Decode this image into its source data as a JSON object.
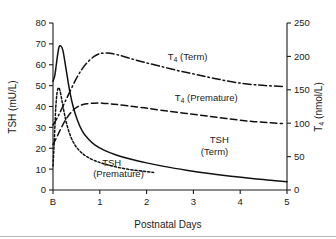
{
  "chart_data": {
    "type": "line",
    "title": "",
    "xlabel": "Postnatal Days",
    "ylabel": "TSH (mU/L)",
    "y2label": "T4 (nmol/L)",
    "xtick_labels": [
      "B",
      "1",
      "2",
      "3",
      "4",
      "5"
    ],
    "xtick_values": [
      0,
      1,
      2,
      3,
      4,
      5
    ],
    "xlim": [
      0,
      5
    ],
    "ytick_labels": [
      "0",
      "10",
      "20",
      "30",
      "40",
      "50",
      "60",
      "70",
      "80"
    ],
    "ytick_values": [
      0,
      10,
      20,
      30,
      40,
      50,
      60,
      70,
      80
    ],
    "ylim": [
      0,
      80
    ],
    "y2tick_labels": [
      "0",
      "50",
      "100",
      "150",
      "200",
      "250"
    ],
    "y2tick_values": [
      0,
      50,
      100,
      150,
      200,
      250
    ],
    "y2lim": [
      0,
      250
    ],
    "grid": false,
    "legend_position": "inline-annotations",
    "series": [
      {
        "name": "TSH (Term)",
        "axis": "left",
        "style": "solid",
        "label_lines": [
          "TSH",
          "(Term)"
        ],
        "label_x": 3.35,
        "label_y_line1": 22.5,
        "label_y_line2": 17.0,
        "points": [
          [
            0.0,
            52.0
          ],
          [
            0.04,
            55.0
          ],
          [
            0.07,
            60.0
          ],
          [
            0.1,
            65.0
          ],
          [
            0.13,
            68.5
          ],
          [
            0.17,
            69.0
          ],
          [
            0.21,
            67.0
          ],
          [
            0.25,
            62.0
          ],
          [
            0.3,
            55.0
          ],
          [
            0.36,
            47.0
          ],
          [
            0.43,
            40.0
          ],
          [
            0.52,
            33.5
          ],
          [
            0.62,
            28.5
          ],
          [
            0.75,
            24.5
          ],
          [
            0.9,
            21.5
          ],
          [
            1.1,
            19.0
          ],
          [
            1.35,
            16.8
          ],
          [
            1.65,
            14.8
          ],
          [
            2.0,
            13.0
          ],
          [
            2.4,
            11.2
          ],
          [
            2.85,
            9.5
          ],
          [
            3.3,
            8.0
          ],
          [
            3.8,
            6.6
          ],
          [
            4.3,
            5.4
          ],
          [
            4.7,
            4.6
          ],
          [
            5.0,
            4.0
          ]
        ]
      },
      {
        "name": "TSH (Premature)",
        "axis": "left",
        "style": "dotted",
        "label_lines": [
          "TSH",
          "(Premature)"
        ],
        "label_x": 1.05,
        "label_y_line1": 11.5,
        "label_y_line2": 6.0,
        "points": [
          [
            0.0,
            11.5
          ],
          [
            0.02,
            20.0
          ],
          [
            0.04,
            30.0
          ],
          [
            0.06,
            40.0
          ],
          [
            0.09,
            47.0
          ],
          [
            0.12,
            49.0
          ],
          [
            0.15,
            47.5
          ],
          [
            0.19,
            43.0
          ],
          [
            0.24,
            37.0
          ],
          [
            0.3,
            31.0
          ],
          [
            0.38,
            25.5
          ],
          [
            0.47,
            21.5
          ],
          [
            0.58,
            18.5
          ],
          [
            0.72,
            16.0
          ],
          [
            0.9,
            14.0
          ],
          [
            1.12,
            12.3
          ],
          [
            1.4,
            10.8
          ],
          [
            1.7,
            9.6
          ],
          [
            2.0,
            8.8
          ],
          [
            2.15,
            8.4
          ]
        ]
      },
      {
        "name": "T4 (Term)",
        "axis": "right",
        "style": "dashdot",
        "label_lines": [
          "T4 (Term)"
        ],
        "label_x": 2.45,
        "label_y": 195,
        "points": [
          [
            0.0,
            97.0
          ],
          [
            0.12,
            112.0
          ],
          [
            0.25,
            131.0
          ],
          [
            0.38,
            150.0
          ],
          [
            0.5,
            167.0
          ],
          [
            0.62,
            181.0
          ],
          [
            0.75,
            192.0
          ],
          [
            0.88,
            200.0
          ],
          [
            1.0,
            204.0
          ],
          [
            1.15,
            205.0
          ],
          [
            1.35,
            203.0
          ],
          [
            1.6,
            198.0
          ],
          [
            1.9,
            192.0
          ],
          [
            2.25,
            186.0
          ],
          [
            2.65,
            179.0
          ],
          [
            3.05,
            173.0
          ],
          [
            3.45,
            167.0
          ],
          [
            3.9,
            161.0
          ],
          [
            4.4,
            157.0
          ],
          [
            4.9,
            155.0
          ]
        ]
      },
      {
        "name": "T4 (Premature)",
        "axis": "right",
        "style": "dashed",
        "label_lines": [
          "T4 (Premature)"
        ],
        "label_x": 2.6,
        "label_y": 133,
        "points": [
          [
            0.0,
            68.0
          ],
          [
            0.08,
            79.0
          ],
          [
            0.17,
            92.0
          ],
          [
            0.26,
            104.0
          ],
          [
            0.36,
            114.0
          ],
          [
            0.47,
            122.0
          ],
          [
            0.58,
            126.5
          ],
          [
            0.72,
            129.0
          ],
          [
            0.88,
            130.0
          ],
          [
            1.05,
            130.0
          ],
          [
            1.3,
            128.5
          ],
          [
            1.6,
            126.0
          ],
          [
            1.95,
            123.0
          ],
          [
            2.35,
            119.0
          ],
          [
            2.8,
            115.0
          ],
          [
            3.25,
            111.0
          ],
          [
            3.7,
            107.0
          ],
          [
            4.2,
            103.0
          ],
          [
            4.65,
            100.5
          ],
          [
            4.9,
            99.5
          ]
        ]
      }
    ]
  }
}
